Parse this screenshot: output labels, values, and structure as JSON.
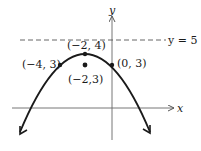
{
  "diagram": {
    "type": "parabola",
    "equation_direction": "opens-down",
    "axes": {
      "x_label": "x",
      "y_label": "y"
    },
    "directrix": {
      "label": "y = 5",
      "y": 5,
      "style": "dashed"
    },
    "points": [
      {
        "id": "vertex",
        "label": "(−2, 4)",
        "x": -2,
        "y": 4
      },
      {
        "id": "focus",
        "label": "(−2,3)",
        "x": -2,
        "y": 3
      },
      {
        "id": "left-latus",
        "label": "(−4, 3)",
        "x": -4,
        "y": 3
      },
      {
        "id": "right-latus",
        "label": "(0, 3)",
        "x": 0,
        "y": 3
      }
    ],
    "colors": {
      "stroke": "#1a1a1a",
      "background": "#ffffff"
    }
  }
}
